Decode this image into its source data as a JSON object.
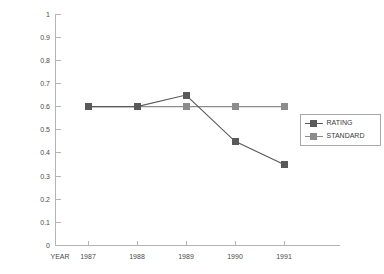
{
  "chart_data": {
    "type": "line",
    "title": "",
    "xlabel": "YEAR",
    "ylabel": "",
    "categories": [
      "1987",
      "1988",
      "1989",
      "1990",
      "1991"
    ],
    "x_axis_title": "YEAR",
    "ylim": [
      0,
      1
    ],
    "y_ticks": [
      "1",
      "0.9",
      "0.8",
      "0.7",
      "0.6",
      "0.5",
      "0.4",
      "0.3",
      "0.2",
      "0.1",
      "0"
    ],
    "y_tick_values": [
      1,
      0.9,
      0.8,
      0.7,
      0.6,
      0.5,
      0.4,
      0.3,
      0.2,
      0.1,
      0
    ],
    "grid": false,
    "legend_position": "right",
    "series": [
      {
        "name": "RATING",
        "label": "RATING",
        "color": "#595959",
        "marker": "square",
        "values": [
          0.6,
          0.6,
          0.65,
          0.45,
          0.35
        ]
      },
      {
        "name": "STANDARD",
        "label": "STANDARD",
        "color": "#8c8c8c",
        "marker": "square",
        "values": [
          0.6,
          0.6,
          0.6,
          0.6,
          0.6
        ]
      }
    ]
  },
  "colors": {
    "rating": "#595959",
    "standard": "#8c8c8c",
    "axis": "#b4b4b4",
    "text": "#4a4a4a",
    "legend_border": "#a8a8a8",
    "background": "#ffffff"
  },
  "legend": {
    "entries": [
      {
        "label": "RATING"
      },
      {
        "label": "STANDARD"
      }
    ]
  },
  "axis": {
    "y_labels": [
      "1",
      "0.9",
      "0.8",
      "0.7",
      "0.6",
      "0.5",
      "0.4",
      "0.3",
      "0.2",
      "0.1",
      "0"
    ],
    "x_labels": [
      "1987",
      "1988",
      "1989",
      "1990",
      "1991"
    ],
    "x_title": "YEAR"
  }
}
